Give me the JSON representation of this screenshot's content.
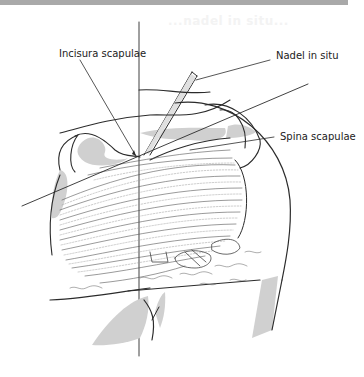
{
  "figure": {
    "type": "anatomical-illustration",
    "faint_heading_bleed": "...nadel in situ...",
    "labels": {
      "incisura": "Incisura scapulae",
      "nadel": "Nadel in situ",
      "spina": "Spina scapulae"
    },
    "colors": {
      "line": "#2b2b2b",
      "shade": "#d0d0d0",
      "topbar": "#a9a9a9",
      "background": "#ffffff"
    }
  }
}
